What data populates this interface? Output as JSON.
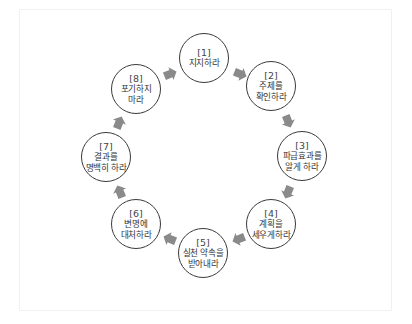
{
  "diagram": {
    "type": "cycle",
    "arrow_color": "#8a8a8a",
    "nodes": [
      {
        "num": "[1]",
        "lines": [
          "지지하라"
        ]
      },
      {
        "num": "[2]",
        "lines": [
          "주제를",
          "확인하라"
        ]
      },
      {
        "num": "[3]",
        "lines": [
          "파급효과를",
          "알게 하라"
        ]
      },
      {
        "num": "[4]",
        "lines": [
          "계획을",
          "세우게하라"
        ]
      },
      {
        "num": "[5]",
        "lines": [
          "실천 약속을",
          "받아내라"
        ]
      },
      {
        "num": "[6]",
        "lines": [
          "변명에",
          "대처하라"
        ]
      },
      {
        "num": "[7]",
        "lines": [
          "결과를",
          "명백히 하라"
        ]
      },
      {
        "num": "[8]",
        "lines": [
          "포기하지",
          "마라"
        ]
      }
    ]
  }
}
